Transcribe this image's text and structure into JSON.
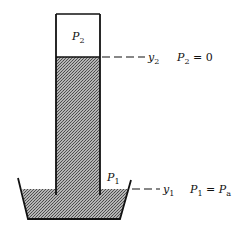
{
  "diagram": {
    "type": "barometer",
    "labels": {
      "top_pressure": {
        "main": "P",
        "sub": "2"
      },
      "top_level": {
        "main": "y",
        "sub": "2"
      },
      "top_equation": {
        "main": "P",
        "sub": "2",
        "rest": " = 0"
      },
      "bottom_pressure": {
        "main": "P",
        "sub": "1"
      },
      "bottom_level": {
        "main": "y",
        "sub": "1"
      },
      "bottom_equation": {
        "main": "P",
        "sub": "1",
        "eq": " = P",
        "sub2": "a"
      }
    },
    "colors": {
      "stroke": "#111111",
      "fluid": "#8a8a8a",
      "background": "#ffffff"
    }
  }
}
